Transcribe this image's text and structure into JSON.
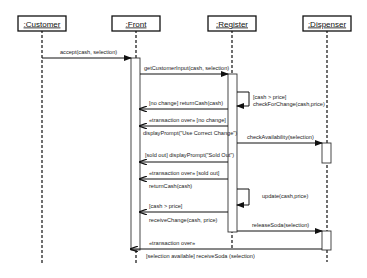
{
  "diagram": {
    "type": "uml-sequence",
    "objects": [
      {
        "id": "customer",
        "label": ":Customer",
        "x": 42
      },
      {
        "id": "front",
        "label": ":Front",
        "x": 136
      },
      {
        "id": "register",
        "label": ":Register",
        "x": 232
      },
      {
        "id": "dispenser",
        "label": ":Dispenser",
        "x": 327
      }
    ],
    "messages": [
      {
        "from": "customer",
        "to": "front",
        "label": "accept(cash, selection)",
        "kind": "call"
      },
      {
        "from": "front",
        "to": "register",
        "label": "getCustomerInput(cash, selection)",
        "kind": "call"
      },
      {
        "from": "register",
        "to": "register",
        "label": "[cash > price]",
        "label2": "checkForChange(cash,price)",
        "kind": "self"
      },
      {
        "from": "register",
        "to": "front",
        "label": "[no change] returnCash(cash)",
        "kind": "return"
      },
      {
        "from": "register",
        "to": "front",
        "label": "«transaction over» [no change]",
        "kind": "return"
      },
      {
        "from": "register",
        "to": "front",
        "label": "displayPrompt(\"Use Correct Change\")",
        "kind": "return-label-above"
      },
      {
        "from": "register",
        "to": "dispenser",
        "label": "checkAvailability(selection)",
        "kind": "call"
      },
      {
        "from": "register",
        "to": "front",
        "label": "[sold out] displayPrompt(\"Sold Out\")",
        "kind": "return"
      },
      {
        "from": "register",
        "to": "front",
        "label": "«transaction over» [sold out]",
        "kind": "return"
      },
      {
        "from": "register",
        "to": "front",
        "label": "returnCash(cash)",
        "kind": "label-only"
      },
      {
        "from": "register",
        "to": "register",
        "label": "update(cash,price)",
        "kind": "self"
      },
      {
        "from": "register",
        "to": "front",
        "label": "[cash > price]",
        "label2": "receiveChange(cash, price)",
        "kind": "return"
      },
      {
        "from": "register",
        "to": "dispenser",
        "label": "releaseSoda(selection)",
        "kind": "call"
      },
      {
        "from": "dispenser",
        "to": "front",
        "label": "«transaction over»",
        "label2": "[selection available] receiveSoda (selection)",
        "kind": "return"
      }
    ]
  },
  "labels": {
    "customer": ":Customer",
    "front": ":Front",
    "register": ":Register",
    "dispenser": ":Dispenser",
    "m1": "accept(cash, selection)",
    "m2": "getCustomerInput(cash, selection)",
    "m3a": "[cash > price]",
    "m3b": "checkForChange(cash,price)",
    "m4": "[no change] returnCash(cash)",
    "m5": "«transaction over» [no change]",
    "m6": "displayPrompt(\"Use Correct Change\")",
    "m7": "checkAvailability(selection)",
    "m8": "[sold out] displayPrompt(\"Sold Out\")",
    "m9": "«transaction over» [sold out]",
    "m10": "returnCash(cash)",
    "m11": "update(cash,price)",
    "m12a": "[cash > price]",
    "m12b": "receiveChange(cash, price)",
    "m13": "releaseSoda(selection)",
    "m14a": "«transaction over»",
    "m14b": "[selection available] receiveSoda (selection)"
  }
}
